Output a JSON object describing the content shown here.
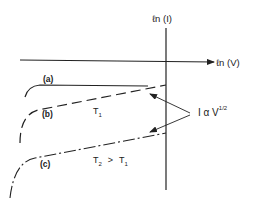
{
  "diagram": {
    "axes": {
      "x_label": "ℓn (V)",
      "y_label": "ℓn (I)"
    },
    "curves": [
      {
        "id": "a",
        "label": "(a)",
        "style": "solid"
      },
      {
        "id": "b",
        "label": "(b)",
        "style": "dashed",
        "temperature": "T",
        "temperature_sub": "1"
      },
      {
        "id": "c",
        "label": "(c)",
        "style": "dash-dot",
        "temperature_relation": {
          "left": "T",
          "left_sub": "2",
          "op": ">",
          "right": "T",
          "right_sub": "1"
        }
      }
    ],
    "annotation": {
      "text_main": "I α V",
      "text_sup": "1/2",
      "points_to": [
        "b",
        "c"
      ]
    },
    "colors": {
      "ink": "#222222",
      "background": "#ffffff"
    }
  }
}
